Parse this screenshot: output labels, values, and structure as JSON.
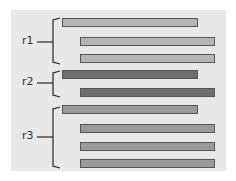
{
  "colors": {
    "background": "#e8e8e8",
    "light_bar": "#b4b4b4",
    "dark_bar": "#6e6e6e",
    "mid_bar": "#9a9a9a"
  },
  "groups": [
    {
      "label": "r1",
      "bars": [
        {
          "x": 62,
          "y": 18,
          "w": 134,
          "tone": "light"
        },
        {
          "x": 80,
          "y": 37,
          "w": 133,
          "tone": "light"
        },
        {
          "x": 80,
          "y": 54,
          "w": 133,
          "tone": "light"
        }
      ]
    },
    {
      "label": "r2",
      "bars": [
        {
          "x": 62,
          "y": 70,
          "w": 134,
          "tone": "dark"
        },
        {
          "x": 80,
          "y": 88,
          "w": 133,
          "tone": "dark"
        }
      ]
    },
    {
      "label": "r3",
      "bars": [
        {
          "x": 62,
          "y": 105,
          "w": 134,
          "tone": "mid"
        },
        {
          "x": 80,
          "y": 124,
          "w": 133,
          "tone": "mid"
        },
        {
          "x": 80,
          "y": 142,
          "w": 133,
          "tone": "mid"
        },
        {
          "x": 80,
          "y": 159,
          "w": 133,
          "tone": "mid"
        }
      ]
    }
  ]
}
